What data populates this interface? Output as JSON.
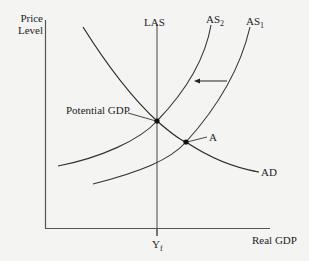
{
  "diagram": {
    "y_axis_label_line1": "Price",
    "y_axis_label_line2": "Level",
    "x_axis_label": "Real GDP",
    "x_tick_label_main": "Y",
    "x_tick_label_sub": "f",
    "curves": {
      "las": "LAS",
      "as2_main": "AS",
      "as2_sub": "2",
      "as1_main": "AS",
      "as1_sub": "1",
      "ad": "AD"
    },
    "points": {
      "potential_gdp": "Potential GDP",
      "a": "A"
    },
    "arrow_direction": "left",
    "colors": {
      "line": "#2a2a2a",
      "background": "#f4f4f2"
    }
  }
}
